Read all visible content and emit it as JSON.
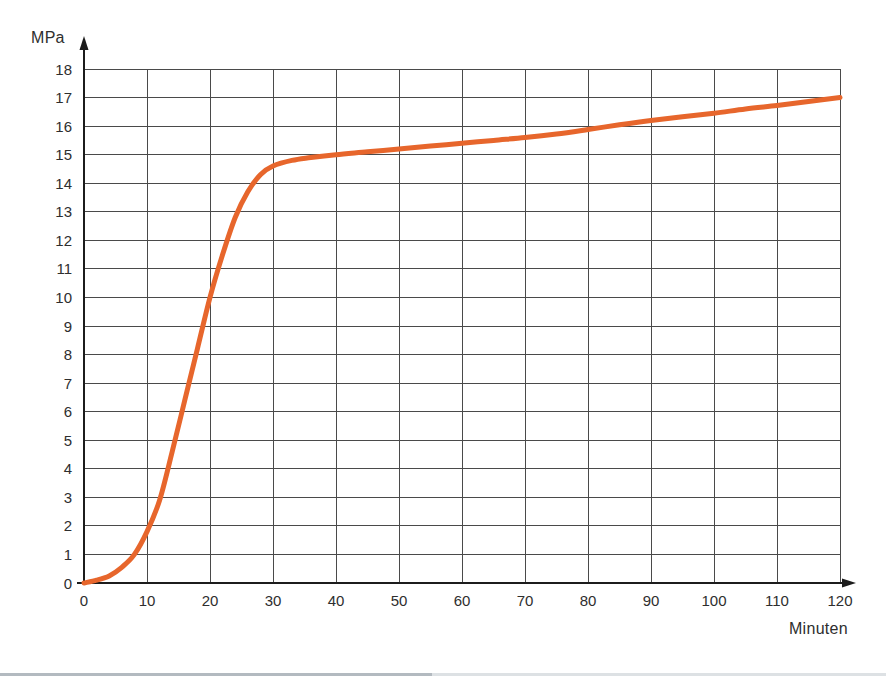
{
  "chart_data": {
    "type": "line",
    "title": "",
    "xlabel": "Minuten",
    "ylabel": "MPa",
    "xlim": [
      0,
      120
    ],
    "ylim": [
      0,
      18
    ],
    "x_ticks": [
      0,
      10,
      20,
      30,
      40,
      50,
      60,
      70,
      80,
      90,
      100,
      110,
      120
    ],
    "y_ticks": [
      0,
      1,
      2,
      3,
      4,
      5,
      6,
      7,
      8,
      9,
      10,
      11,
      12,
      13,
      14,
      15,
      16,
      17,
      18
    ],
    "grid": true,
    "legend": "none",
    "series": [
      {
        "name": "pressure-over-time",
        "color": "#E7662C",
        "points": [
          [
            0,
            0
          ],
          [
            2,
            0.1
          ],
          [
            4,
            0.25
          ],
          [
            6,
            0.55
          ],
          [
            8,
            1.0
          ],
          [
            10,
            1.8
          ],
          [
            12,
            2.9
          ],
          [
            14,
            4.6
          ],
          [
            16,
            6.4
          ],
          [
            18,
            8.2
          ],
          [
            20,
            10.0
          ],
          [
            22,
            11.5
          ],
          [
            24,
            12.8
          ],
          [
            26,
            13.7
          ],
          [
            28,
            14.3
          ],
          [
            30,
            14.6
          ],
          [
            33,
            14.8
          ],
          [
            36,
            14.9
          ],
          [
            40,
            15.0
          ],
          [
            45,
            15.1
          ],
          [
            50,
            15.2
          ],
          [
            55,
            15.3
          ],
          [
            60,
            15.4
          ],
          [
            65,
            15.5
          ],
          [
            70,
            15.6
          ],
          [
            75,
            15.72
          ],
          [
            80,
            15.88
          ],
          [
            85,
            16.05
          ],
          [
            90,
            16.2
          ],
          [
            95,
            16.33
          ],
          [
            100,
            16.45
          ],
          [
            105,
            16.6
          ],
          [
            110,
            16.72
          ],
          [
            115,
            16.86
          ],
          [
            120,
            17.0
          ]
        ]
      }
    ]
  },
  "colors": {
    "curve": "#E7662C",
    "grid": "#4a4a4a",
    "axis": "#1c1c1c",
    "tick_text": "#2e2e2e",
    "bottom_strip_light": "#dde1e4",
    "bottom_strip_dark": "#b3bac0"
  }
}
